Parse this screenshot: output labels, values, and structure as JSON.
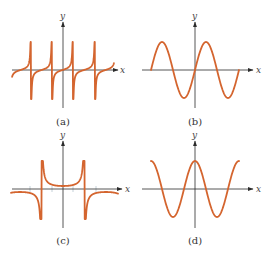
{
  "figure": {
    "width": 273,
    "height": 258,
    "curve_color": "#d4652f",
    "axis_color": "#2b2b2b"
  },
  "chart_data": [
    {
      "type": "line",
      "panel": "a",
      "caption": "(a)",
      "xlabel": "x",
      "ylabel": "y",
      "function_shape": "tangent-like (increasing branches between vertical asymptotes)",
      "axes_px": {
        "origin": [
          63,
          70
        ],
        "x_range": [
          12,
          118
        ],
        "y_range": [
          22,
          108
        ]
      },
      "asymptotes_px_x": [
        31,
        52,
        73,
        95
      ],
      "curve_y_extent_px": [
        42,
        99
      ],
      "grid": false,
      "legend": null
    },
    {
      "type": "line",
      "panel": "b",
      "caption": "(b)",
      "xlabel": "x",
      "ylabel": "y",
      "function_shape": "sine-like",
      "axes_px": {
        "origin": [
          195,
          70
        ],
        "x_range": [
          142,
          253
        ],
        "y_range": [
          22,
          108
        ]
      },
      "curve_x_extent_px": [
        151,
        239
      ],
      "amplitude_px": 28,
      "half_period_px": 22,
      "grid": false,
      "legend": null
    },
    {
      "type": "line",
      "panel": "c",
      "caption": "(c)",
      "xlabel": "x",
      "ylabel": "y",
      "function_shape": "secant-like (U and inverted-U branches between vertical asymptotes)",
      "axes_px": {
        "origin": [
          63,
          189
        ],
        "x_range": [
          12,
          122
        ],
        "y_range": [
          140,
          228
        ]
      },
      "asymptotes_px_x": [
        30,
        52,
        73,
        96
      ],
      "curve_y_extent_px": [
        161,
        219
      ],
      "grid": false,
      "legend": null
    },
    {
      "type": "line",
      "panel": "d",
      "caption": "(d)",
      "xlabel": "x",
      "ylabel": "y",
      "function_shape": "cosine-like",
      "axes_px": {
        "origin": [
          195,
          189
        ],
        "x_range": [
          142,
          253
        ],
        "y_range": [
          140,
          228
        ]
      },
      "curve_x_extent_px": [
        151,
        239
      ],
      "amplitude_px": 28,
      "half_period_px": 22,
      "grid": false,
      "legend": null
    }
  ],
  "panels": {
    "a": {
      "caption": "(a)",
      "xlabel": "x",
      "ylabel": "y"
    },
    "b": {
      "caption": "(b)",
      "xlabel": "x",
      "ylabel": "y"
    },
    "c": {
      "caption": "(c)",
      "xlabel": "x",
      "ylabel": "y"
    },
    "d": {
      "caption": "(d)",
      "xlabel": "x",
      "ylabel": "y"
    }
  }
}
